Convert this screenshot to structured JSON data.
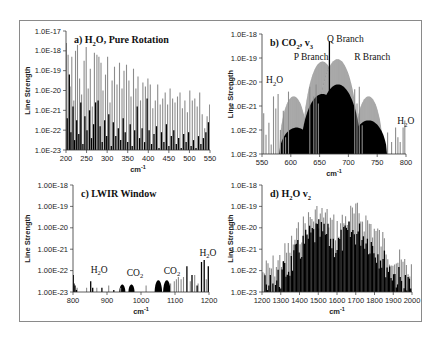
{
  "figure": {
    "frame_color": "#8a8a8a",
    "gray_color": "#8c8c8c",
    "black_color": "#000000"
  },
  "chart_data": [
    {
      "id": "a",
      "type": "bar",
      "title": "a) H2O, Pure Rotation",
      "title_parts": [
        "a) H",
        "2",
        "O, Pure Rotation"
      ],
      "xlabel": "cm-1",
      "ylabel": "Line Strength",
      "yscale": "log",
      "ylim_exp": [
        -23,
        -17
      ],
      "ytick_labels": [
        "1.0E-23",
        "1.0E-22",
        "1.0E-21",
        "1.0E-20",
        "1.0E-19",
        "1.0E-18",
        "1.0E-17"
      ],
      "xlim": [
        200,
        550
      ],
      "xticks": [
        200,
        250,
        300,
        350,
        400,
        450,
        500,
        550
      ],
      "plot_box": [
        66,
        31,
        210,
        150
      ],
      "annotations": [],
      "series": [
        {
          "name": "strong lines",
          "color": "gray",
          "x": [
            201,
            205,
            210,
            214,
            219,
            223,
            228,
            233,
            238,
            244,
            249,
            254,
            259,
            264,
            269,
            275,
            280,
            285,
            290,
            296,
            301,
            307,
            312,
            318,
            324,
            330,
            336,
            341,
            347,
            353,
            358,
            364,
            370,
            375,
            381,
            387,
            393,
            399,
            405,
            411,
            417,
            423,
            429,
            435,
            441,
            447,
            453,
            459,
            465,
            471,
            477,
            483,
            489,
            495,
            501,
            507,
            513,
            519,
            525,
            531,
            537,
            543,
            549
          ],
          "y": [
            -17.6,
            -18.2,
            -19.8,
            -18.3,
            -20.5,
            -18.0,
            -17.7,
            -19.4,
            -20.2,
            -18.5,
            -17.8,
            -19.9,
            -18.9,
            -20.8,
            -18.1,
            -18.2,
            -18.3,
            -18.6,
            -20.0,
            -19.2,
            -18.3,
            -20.6,
            -19.5,
            -18.8,
            -19.7,
            -18.6,
            -19.9,
            -19.0,
            -18.7,
            -19.5,
            -20.3,
            -18.9,
            -19.9,
            -19.3,
            -20.5,
            -19.6,
            -19.8,
            -19.4,
            -19.7,
            -20.9,
            -20.5,
            -19.7,
            -20.7,
            -20.4,
            -20.1,
            -20.7,
            -19.9,
            -20.4,
            -20.6,
            -20.3,
            -20.1,
            -20.9,
            -20.5,
            -21.1,
            -20.0,
            -20.5,
            -20.4,
            -20.8,
            -20.1,
            -21.2,
            -21.9,
            -21.3,
            -20.7
          ]
        },
        {
          "name": "weak lines",
          "color": "black",
          "x": [
            203,
            208,
            212,
            217,
            221,
            226,
            231,
            236,
            241,
            246,
            251,
            257,
            262,
            267,
            272,
            278,
            283,
            288,
            294,
            299,
            304,
            310,
            315,
            321,
            327,
            333,
            339,
            344,
            350,
            356,
            361,
            367,
            373,
            379,
            385,
            391,
            397,
            402,
            408,
            414,
            420,
            426,
            432,
            438,
            444,
            450,
            456,
            462,
            468,
            474,
            480,
            486,
            492,
            498,
            504,
            510,
            516,
            522,
            528,
            534,
            540,
            546
          ],
          "y": [
            -21.4,
            -19.2,
            -22.1,
            -20.8,
            -22.5,
            -21.5,
            -22.2,
            -20.6,
            -22.7,
            -21.3,
            -22.0,
            -21.0,
            -22.4,
            -21.7,
            -20.6,
            -20.5,
            -21.8,
            -22.6,
            -21.5,
            -22.3,
            -21.2,
            -22.8,
            -21.6,
            -22.3,
            -21.9,
            -22.5,
            -21.4,
            -22.1,
            -22.6,
            -21.7,
            -22.8,
            -22.0,
            -20.8,
            -22.4,
            -21.9,
            -22.6,
            -20.4,
            -22.0,
            -22.7,
            -22.2,
            -21.8,
            -22.9,
            -22.1,
            -22.6,
            -21.7,
            -22.8,
            -22.3,
            -22.0,
            -22.7,
            -22.4,
            -22.9,
            -22.2,
            -22.6,
            -22.1,
            -22.8,
            -22.5,
            -22.9,
            -22.3,
            -22.7,
            -22.4,
            -22.1,
            -21.6
          ]
        }
      ],
      "bands": []
    },
    {
      "id": "b",
      "type": "bar",
      "title": "b) CO2, v3",
      "title_parts": [
        "b) CO",
        "2",
        ", v",
        "3"
      ],
      "xlabel": "cm-1",
      "ylabel": "Line Strength",
      "yscale": "log",
      "ylim_exp": [
        -23,
        -18
      ],
      "ytick_labels": [
        "1.0E-23",
        "1.0E-22",
        "1.0E-21",
        "1.0E-20",
        "1.0E-19",
        "1.0E-18"
      ],
      "xlim": [
        550,
        800
      ],
      "xticks": [
        550,
        600,
        650,
        700,
        750,
        800
      ],
      "plot_box": [
        262,
        34,
        406,
        154
      ],
      "annotations": [
        {
          "text": "Q Branch",
          "x": 663,
          "y_exp": -18.35
        },
        {
          "text": "P Branch",
          "x": 605,
          "y_exp": -19.1
        },
        {
          "text": "R Branch",
          "x": 710,
          "y_exp": -19.1
        },
        {
          "text": "H2O",
          "parts": [
            "H",
            "2",
            "O"
          ],
          "x": 557,
          "y_exp": -20.05
        },
        {
          "text": "H2O",
          "parts": [
            "H",
            "2",
            "O"
          ],
          "x": 785,
          "y_exp": -21.75
        }
      ],
      "bands": [
        {
          "name": "P branch envelope (strong)",
          "color": "gray",
          "center": 655,
          "half_width": 35,
          "peak_exp": -19.15
        },
        {
          "name": "R branch envelope (strong)",
          "color": "gray",
          "center": 681,
          "half_width": 37,
          "peak_exp": -19.05
        },
        {
          "name": "hot band P",
          "color": "gray",
          "center": 605,
          "half_width": 25,
          "peak_exp": -20.6
        },
        {
          "name": "hot band R",
          "color": "gray",
          "center": 735,
          "half_width": 25,
          "peak_exp": -20.6
        },
        {
          "name": "weak envelope 1",
          "color": "black",
          "center": 655,
          "half_width": 38,
          "peak_exp": -20.5
        },
        {
          "name": "weak envelope 2",
          "color": "black",
          "center": 682,
          "half_width": 40,
          "peak_exp": -20.1
        },
        {
          "name": "weak envelope 3",
          "color": "black",
          "center": 610,
          "half_width": 30,
          "peak_exp": -21.9
        },
        {
          "name": "weak envelope 4",
          "color": "black",
          "center": 735,
          "half_width": 32,
          "peak_exp": -21.6
        }
      ],
      "series": [
        {
          "name": "H2O lines",
          "color": "gray",
          "x": [
            553,
            557,
            562,
            566,
            570,
            574,
            578,
            582,
            587,
            591,
            596,
            633,
            640,
            644,
            648,
            711,
            715,
            719,
            724,
            768,
            775,
            782,
            786,
            790,
            795,
            798
          ],
          "y": [
            -21.3,
            -22.2,
            -21.7,
            -22.6,
            -20.6,
            -21.1,
            -20.5,
            -22.0,
            -21.2,
            -22.3,
            -20.4,
            -20.2,
            -20.6,
            -20.1,
            -20.9,
            -20.3,
            -20.9,
            -20.2,
            -21.8,
            -22.1,
            -22.5,
            -21.9,
            -22.3,
            -22.5,
            -21.9,
            -21.6
          ]
        },
        {
          "name": "Q branch",
          "color": "black",
          "x": [
            667
          ],
          "y": [
            -18.3
          ]
        }
      ]
    },
    {
      "id": "c",
      "type": "bar",
      "title": "c) LWIR Window",
      "title_parts": [
        "c) LWIR Window"
      ],
      "xlabel": "cm-1",
      "ylabel": "Line Strength",
      "yscale": "log",
      "ylim_exp": [
        -23,
        -18
      ],
      "ytick_labels": [
        "1.00E-23",
        "1.00E-22",
        "1.00E-21",
        "1.00E-20",
        "1.00E-19",
        "1.00E-18"
      ],
      "xlim": [
        800,
        1200
      ],
      "xticks": [
        800,
        900,
        1000,
        1100,
        1200
      ],
      "plot_box": [
        73,
        185,
        209,
        292
      ],
      "annotations": [
        {
          "text": "H2O",
          "parts": [
            "H",
            "2",
            "O"
          ],
          "x": 852,
          "y_exp": -22.1
        },
        {
          "text": "CO2",
          "parts": [
            "CO",
            "2"
          ],
          "x": 958,
          "y_exp": -22.25
        },
        {
          "text": "CO2",
          "parts": [
            "CO",
            "2"
          ],
          "x": 1067,
          "y_exp": -22.15
        },
        {
          "text": "H2O",
          "parts": [
            "H",
            "2",
            "O"
          ],
          "x": 1172,
          "y_exp": -21.3
        }
      ],
      "bands": [
        {
          "name": "CO2 band 1",
          "color": "black",
          "center": 945,
          "half_width": 9,
          "peak_exp": -22.65
        },
        {
          "name": "CO2 band 2",
          "color": "black",
          "center": 972,
          "half_width": 9,
          "peak_exp": -22.65
        },
        {
          "name": "CO2 band 3",
          "color": "black",
          "center": 1051,
          "half_width": 11,
          "peak_exp": -22.45
        },
        {
          "name": "CO2 band 4",
          "color": "black",
          "center": 1076,
          "half_width": 11,
          "peak_exp": -22.45
        }
      ],
      "series": [
        {
          "name": "H2O lines gray",
          "color": "gray",
          "x": [
            812,
            840,
            870,
            905,
            940,
            1015,
            1087,
            1098,
            1104,
            1110,
            1118,
            1125,
            1145,
            1158,
            1168,
            1192
          ],
          "y": [
            -22.8,
            -22.8,
            -22.8,
            -22.7,
            -22.8,
            -22.7,
            -22.6,
            -22.5,
            -22.4,
            -22.3,
            -22.4,
            -22.3,
            -22.5,
            -22.2,
            -22.6,
            -22.4
          ]
        },
        {
          "name": "H2O lines black",
          "color": "black",
          "x": [
            801,
            803,
            806,
            810,
            852,
            858,
            885,
            920,
            1135,
            1150,
            1165,
            1178,
            1186,
            1198
          ],
          "y": [
            -22.2,
            -22.6,
            -22.7,
            -22.9,
            -22.5,
            -22.8,
            -22.8,
            -22.9,
            -21.8,
            -22.2,
            -22.7,
            -21.6,
            -21.5,
            -21.8
          ]
        }
      ]
    },
    {
      "id": "d",
      "type": "bar",
      "title": "d) H2O v2",
      "title_parts": [
        "d) H",
        "2",
        "O v",
        "2"
      ],
      "xlabel": "cm-1",
      "ylabel": "Line Strength",
      "yscale": "log",
      "ylim_exp": [
        -23,
        -18
      ],
      "ytick_labels": [
        "1.0E-23",
        "1.0E-22",
        "1.0E-21",
        "1.0E-20",
        "1.0E-19",
        "1.0E-18"
      ],
      "xlim": [
        1200,
        2000
      ],
      "xticks": [
        1200,
        1300,
        1400,
        1500,
        1600,
        1700,
        1800,
        1900,
        2000
      ],
      "plot_box": [
        262,
        185,
        412,
        292
      ],
      "annotations": [],
      "bands": [],
      "series": [
        {
          "name": "strong lines",
          "color": "gray",
          "envelope": "bimodal",
          "x_start": 1205,
          "x_end": 1998,
          "x_step": 9,
          "peak_exp": -18.75,
          "edge_exp": -21.6
        },
        {
          "name": "weak lines",
          "color": "black",
          "envelope": "bimodal",
          "x_start": 1209,
          "x_end": 1995,
          "x_step": 7,
          "peak_exp": -19.6,
          "edge_exp": -22.4
        }
      ]
    }
  ]
}
